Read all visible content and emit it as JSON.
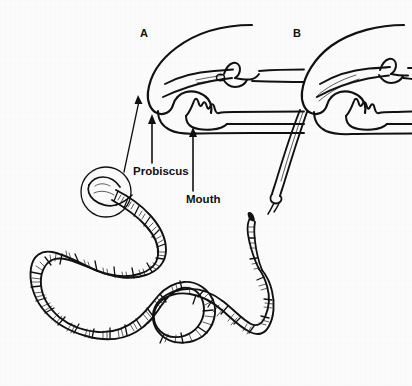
{
  "figure": {
    "background_color": "#fbfbfb",
    "ink_color": "#111111",
    "width": 412,
    "height": 386
  },
  "panels": [
    {
      "id": "A",
      "letter": "A",
      "letter_x": 144,
      "letter_y": 37,
      "description": "Sagittal section of anterior end with proboscis retracted inside the rhynchocoel"
    },
    {
      "id": "B",
      "letter": "B",
      "letter_x": 297,
      "letter_y": 37,
      "description": "Sagittal section of anterior end with proboscis everted and extended outward through the proboscis pore"
    }
  ],
  "callouts": [
    {
      "name": "proboscis",
      "label": "Probiscus",
      "label_x": 133,
      "label_y": 175,
      "arrow_from": [
        152,
        163
      ],
      "arrow_to": [
        152,
        117
      ]
    },
    {
      "name": "mouth",
      "label": "Mouth",
      "label_x": 186,
      "label_y": 203,
      "arrow_from": [
        193,
        191
      ],
      "arrow_to": [
        193,
        129
      ]
    }
  ],
  "magnifier": {
    "name": "head-magnifier-circle",
    "center_x": 106,
    "center_y": 192,
    "radius": 25,
    "leader_from": [
      124,
      172
    ],
    "leader_to": [
      138,
      99
    ]
  },
  "organism": {
    "name": "ribbon-worm-body",
    "segments_visible": true,
    "tail_tapered": true,
    "head_in_magnifier": true
  }
}
